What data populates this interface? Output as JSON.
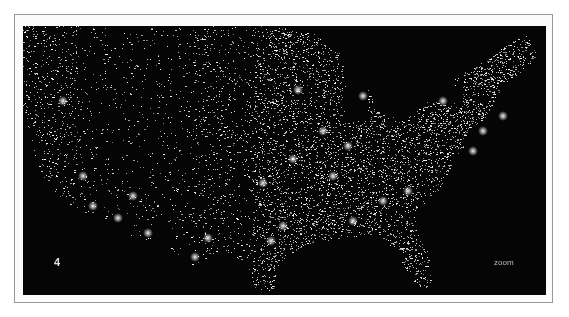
{
  "figure": {
    "panel_number": "4",
    "zoom_label": "zoom",
    "colors": {
      "background": "#050505",
      "lights": "#ffffff",
      "frame_border": "#9a9a9a",
      "page": "#ffffff"
    }
  }
}
